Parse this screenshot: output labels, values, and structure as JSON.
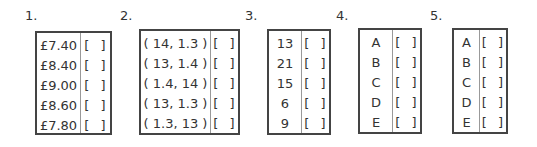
{
  "questions": [
    {
      "label": "1.",
      "options": [
        "£7.40",
        "£8.40",
        "£9.00",
        "£8.60",
        "£7.80"
      ],
      "checkbox": "[  ]"
    },
    {
      "label": "2.",
      "options": [
        "( 14, 1.3 )",
        "( 13, 1.4 )",
        "( 1.4, 14 )",
        "( 13, 1.3 )",
        "( 1.3, 13 )"
      ],
      "checkbox": "[  ]"
    },
    {
      "label": "3.",
      "options": [
        "13",
        "21",
        "15",
        "6",
        "9"
      ],
      "checkbox": "[  ]"
    },
    {
      "label": "4.",
      "options": [
        "A",
        "B",
        "C",
        "D",
        "E"
      ],
      "checkbox": "[  ]"
    },
    {
      "label": "5.",
      "options": [
        "A",
        "B",
        "C",
        "D",
        "E"
      ],
      "checkbox": "[  ]"
    }
  ]
}
